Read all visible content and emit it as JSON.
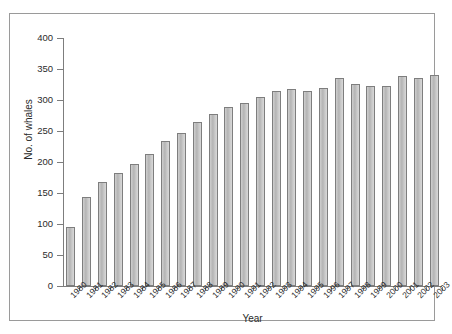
{
  "chart_data": {
    "type": "bar",
    "title": "",
    "subtitle": "",
    "xlabel": "Year",
    "ylabel": "No. of whales",
    "ylim": [
      0,
      400
    ],
    "ytick_step": 50,
    "yticks": [
      0,
      50,
      100,
      150,
      200,
      250,
      300,
      350,
      400
    ],
    "grid": false,
    "legend": "none",
    "bar_color": "#c3c3c3",
    "bar_edge_color": "#7e7e7e",
    "axis_color": "#7d7d7d",
    "categories": [
      "1980",
      "1981",
      "1982",
      "1983",
      "1984",
      "1985",
      "1986",
      "1987",
      "1988",
      "1989",
      "1990",
      "1991",
      "1992",
      "1993",
      "1994",
      "1995",
      "1996",
      "1997",
      "1998",
      "1999",
      "2000",
      "2001",
      "2002",
      "2003"
    ],
    "values": [
      95,
      144,
      167,
      182,
      196,
      213,
      234,
      247,
      264,
      278,
      289,
      295,
      305,
      314,
      318,
      314,
      320,
      335,
      326,
      322,
      322,
      338,
      335,
      341
    ],
    "series": [
      {
        "name": "No. of whales",
        "values": [
          95,
          144,
          167,
          182,
          196,
          213,
          234,
          247,
          264,
          278,
          289,
          295,
          305,
          314,
          318,
          314,
          320,
          335,
          326,
          322,
          322,
          338,
          335,
          341
        ]
      }
    ]
  }
}
